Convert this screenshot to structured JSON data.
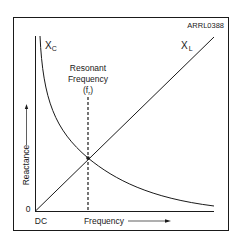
{
  "figure_id": "ARRL0388",
  "axes": {
    "y_label": "Reactance",
    "y_origin": "0",
    "x_origin": "DC",
    "x_label": "Frequency"
  },
  "curves": {
    "capacitive": {
      "symbol": "X",
      "subscript": "C"
    },
    "inductive": {
      "symbol": "X",
      "subscript": "L"
    }
  },
  "resonance": {
    "line1": "Resonant",
    "line2": "Frequency",
    "symbol_open": "(f",
    "symbol_sub": "r",
    "symbol_close": ")"
  },
  "colors": {
    "line": "#1a1a1a",
    "background": "#ffffff"
  }
}
